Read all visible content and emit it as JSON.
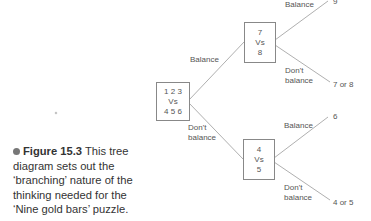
{
  "diagram": {
    "root": {
      "line1": "1 2 3",
      "line2": "Vs",
      "line3": "4 5 6"
    },
    "top_node": {
      "line1": "7",
      "line2": "Vs",
      "line3": "8"
    },
    "bottom_node": {
      "line1": "4",
      "line2": "Vs",
      "line3": "5"
    },
    "edges": {
      "root_to_top": "Balance",
      "root_to_bottom_l1": "Don't",
      "root_to_bottom_l2": "balance",
      "top_balance": "Balance",
      "top_dont_l1": "Don't",
      "top_dont_l2": "balance",
      "bottom_balance": "Balance",
      "bottom_dont_l1": "Don't",
      "bottom_dont_l2": "balance"
    },
    "outcomes": {
      "top_balance": "9",
      "top_dont": "7 or 8",
      "bottom_balance": "6",
      "bottom_dont": "4 or 5"
    },
    "line_color": "#999999"
  },
  "caption": {
    "figure_label": "Figure 15.3",
    "text": " This tree diagram sets out the ‘branching’ nature of the thinking needed for the ‘Nine gold bars’ puzzle."
  }
}
